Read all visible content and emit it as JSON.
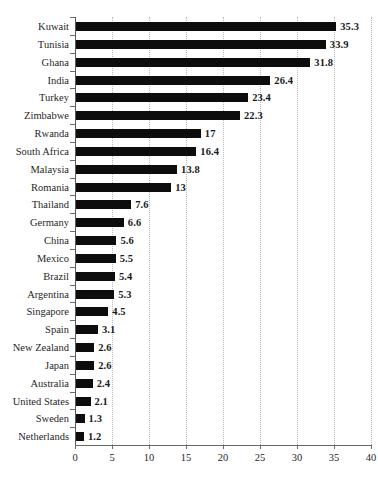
{
  "chart_data": {
    "type": "bar",
    "orientation": "horizontal",
    "title": "",
    "subtitle": "",
    "xlabel": "",
    "ylabel": "",
    "xlim": [
      0,
      40
    ],
    "xticks": [
      0,
      5,
      10,
      15,
      20,
      25,
      30,
      35,
      40
    ],
    "xtick_labels": [
      "0",
      "5",
      "10",
      "15",
      "20",
      "25",
      "30",
      "35",
      "40"
    ],
    "grid": "vertical-dotted",
    "legend": "none",
    "bar_color": "#0d0d0d",
    "grid_color": "#b9b9b9",
    "axis_color": "#6a6a6a",
    "categories": [
      "Kuwait",
      "Tunisia",
      "Ghana",
      "India",
      "Turkey",
      "Zimbabwe",
      "Rwanda",
      "South Africa",
      "Malaysia",
      "Romania",
      "Thailand",
      "Germany",
      "China",
      "Mexico",
      "Brazil",
      "Argentina",
      "Singapore",
      "Spain",
      "New Zealand",
      "Japan",
      "Australia",
      "United States",
      "Sweden",
      "Netherlands"
    ],
    "values": [
      35.3,
      33.9,
      31.8,
      26.4,
      23.4,
      22.3,
      17,
      16.4,
      13.8,
      13,
      7.6,
      6.6,
      5.6,
      5.5,
      5.4,
      5.3,
      4.5,
      3.1,
      2.6,
      2.6,
      2.4,
      2.1,
      1.3,
      1.2
    ],
    "value_labels": [
      "35.3",
      "33.9",
      "31.8",
      "26.4",
      "23.4",
      "22.3",
      "17",
      "16.4",
      "13.8",
      "13",
      "7.6",
      "6.6",
      "5.6",
      "5.5",
      "5.4",
      "5.3",
      "4.5",
      "3.1",
      "2.6",
      "2.6",
      "2.4",
      "2.1",
      "1.3",
      "1.2"
    ]
  }
}
